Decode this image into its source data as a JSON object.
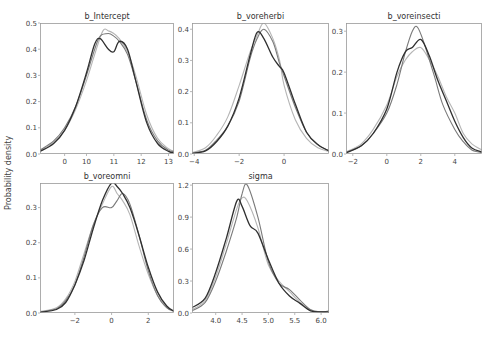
{
  "figure": {
    "ylabel": "Probability density",
    "caption_fragment": "",
    "line_colors": [
      "#2f2f2f",
      "#7a7a7a",
      "#b5b5b5"
    ],
    "frame_color": "#9a9a9a",
    "background": "#ffffff"
  },
  "chart_data": [
    {
      "type": "line",
      "title": "b_Intercept",
      "xlabel": "",
      "ylabel": "Probability density",
      "xlim": [
        8.3,
        13.2
      ],
      "ylim": [
        0,
        0.5
      ],
      "xticks": [
        0,
        10,
        11,
        12,
        13
      ],
      "xtick_positions": [
        9.2,
        10,
        11,
        12,
        13
      ],
      "yticks": [
        0.0,
        0.1,
        0.2,
        0.3,
        0.4,
        0.5
      ],
      "grid": false,
      "series": [
        {
          "name": "chain 1",
          "x": [
            8.3,
            8.8,
            9.2,
            9.6,
            10.0,
            10.3,
            10.5,
            10.8,
            11.0,
            11.2,
            11.5,
            11.8,
            12.2,
            12.6,
            13.0,
            13.2
          ],
          "y": [
            0.01,
            0.04,
            0.09,
            0.18,
            0.31,
            0.42,
            0.44,
            0.4,
            0.39,
            0.43,
            0.4,
            0.28,
            0.12,
            0.04,
            0.01,
            0.005
          ]
        },
        {
          "name": "chain 2",
          "x": [
            8.3,
            8.8,
            9.2,
            9.6,
            10.0,
            10.3,
            10.5,
            10.8,
            11.0,
            11.2,
            11.5,
            11.8,
            12.2,
            12.6,
            13.0,
            13.2
          ],
          "y": [
            0.015,
            0.05,
            0.1,
            0.18,
            0.3,
            0.4,
            0.45,
            0.46,
            0.45,
            0.43,
            0.38,
            0.28,
            0.13,
            0.05,
            0.015,
            0.01
          ]
        },
        {
          "name": "chain 3",
          "x": [
            8.3,
            8.8,
            9.2,
            9.6,
            10.0,
            10.3,
            10.6,
            10.8,
            11.0,
            11.2,
            11.5,
            11.8,
            12.2,
            12.6,
            13.0,
            13.2
          ],
          "y": [
            0.012,
            0.045,
            0.09,
            0.17,
            0.28,
            0.38,
            0.47,
            0.47,
            0.46,
            0.44,
            0.39,
            0.3,
            0.15,
            0.06,
            0.02,
            0.01
          ]
        }
      ]
    },
    {
      "type": "line",
      "title": "b_voreherbi",
      "xlabel": "",
      "ylabel": "",
      "xlim": [
        -4.1,
        2.0
      ],
      "ylim": [
        0,
        0.42
      ],
      "xticks": [
        -4,
        -2,
        0
      ],
      "yticks": [
        0.0,
        0.1,
        0.2,
        0.3,
        0.4
      ],
      "grid": false,
      "series": [
        {
          "name": "chain 1",
          "x": [
            -4.1,
            -3.5,
            -3.0,
            -2.5,
            -2.0,
            -1.5,
            -1.2,
            -0.9,
            -0.5,
            -0.2,
            0.0,
            0.5,
            1.0,
            1.5,
            2.0
          ],
          "y": [
            0.002,
            0.01,
            0.04,
            0.09,
            0.18,
            0.32,
            0.39,
            0.37,
            0.31,
            0.28,
            0.26,
            0.16,
            0.07,
            0.03,
            0.01
          ]
        },
        {
          "name": "chain 2",
          "x": [
            -4.1,
            -3.5,
            -3.0,
            -2.5,
            -2.0,
            -1.5,
            -1.2,
            -0.9,
            -0.5,
            -0.2,
            0.0,
            0.5,
            1.0,
            1.5,
            2.0
          ],
          "y": [
            0.003,
            0.012,
            0.045,
            0.09,
            0.17,
            0.31,
            0.37,
            0.4,
            0.36,
            0.29,
            0.25,
            0.15,
            0.07,
            0.03,
            0.01
          ]
        },
        {
          "name": "chain 3",
          "x": [
            -4.1,
            -3.5,
            -3.0,
            -2.5,
            -2.0,
            -1.5,
            -1.2,
            -0.9,
            -0.5,
            -0.2,
            0.0,
            0.5,
            1.0,
            1.5,
            2.0
          ],
          "y": [
            0.004,
            0.02,
            0.06,
            0.12,
            0.22,
            0.33,
            0.38,
            0.42,
            0.37,
            0.3,
            0.22,
            0.11,
            0.05,
            0.02,
            0.008
          ]
        }
      ]
    },
    {
      "type": "line",
      "title": "b_voreinsecti",
      "xlabel": "",
      "ylabel": "",
      "xlim": [
        -2.4,
        5.6
      ],
      "ylim": [
        0,
        0.32
      ],
      "xticks": [
        -2,
        0,
        2,
        4
      ],
      "yticks": [
        0.0,
        0.1,
        0.2,
        0.3
      ],
      "grid": false,
      "series": [
        {
          "name": "chain 1",
          "x": [
            -2.4,
            -1.5,
            -0.8,
            0.0,
            0.6,
            1.1,
            1.5,
            2.0,
            2.5,
            3.0,
            3.5,
            4.0,
            4.5,
            5.0,
            5.6
          ],
          "y": [
            0.003,
            0.02,
            0.05,
            0.11,
            0.2,
            0.25,
            0.26,
            0.28,
            0.24,
            0.18,
            0.13,
            0.08,
            0.04,
            0.015,
            0.005
          ]
        },
        {
          "name": "chain 2",
          "x": [
            -2.4,
            -1.5,
            -0.8,
            0.0,
            0.6,
            1.1,
            1.5,
            1.8,
            2.2,
            2.8,
            3.3,
            4.0,
            4.5,
            5.0,
            5.6
          ],
          "y": [
            0.004,
            0.02,
            0.05,
            0.1,
            0.17,
            0.25,
            0.3,
            0.31,
            0.27,
            0.19,
            0.12,
            0.06,
            0.03,
            0.01,
            0.004
          ]
        },
        {
          "name": "chain 3",
          "x": [
            -2.4,
            -1.5,
            -0.8,
            0.0,
            0.6,
            1.1,
            1.5,
            2.0,
            2.5,
            3.0,
            3.5,
            4.0,
            4.5,
            5.0,
            5.6
          ],
          "y": [
            0.005,
            0.025,
            0.06,
            0.12,
            0.19,
            0.23,
            0.25,
            0.26,
            0.23,
            0.19,
            0.14,
            0.1,
            0.05,
            0.025,
            0.01
          ]
        }
      ]
    },
    {
      "type": "line",
      "title": "b_voreomni",
      "xlabel": "",
      "ylabel": "Probability density",
      "xlim": [
        -3.9,
        3.4
      ],
      "ylim": [
        0,
        0.37
      ],
      "xticks": [
        -2,
        0,
        2
      ],
      "yticks": [
        0.0,
        0.1,
        0.2,
        0.3
      ],
      "grid": false,
      "series": [
        {
          "name": "chain 1",
          "x": [
            -3.9,
            -3.0,
            -2.5,
            -2.0,
            -1.5,
            -1.0,
            -0.5,
            0.0,
            0.3,
            0.6,
            1.0,
            1.5,
            2.0,
            2.5,
            3.0,
            3.4
          ],
          "y": [
            0.002,
            0.01,
            0.03,
            0.08,
            0.15,
            0.24,
            0.32,
            0.37,
            0.36,
            0.34,
            0.3,
            0.22,
            0.13,
            0.06,
            0.02,
            0.005
          ]
        },
        {
          "name": "chain 2",
          "x": [
            -3.9,
            -3.0,
            -2.5,
            -2.0,
            -1.5,
            -1.0,
            -0.5,
            0.0,
            0.3,
            0.6,
            1.0,
            1.5,
            2.0,
            2.5,
            3.0,
            3.4
          ],
          "y": [
            0.003,
            0.012,
            0.035,
            0.08,
            0.16,
            0.25,
            0.3,
            0.3,
            0.32,
            0.34,
            0.31,
            0.22,
            0.12,
            0.05,
            0.015,
            0.005
          ]
        },
        {
          "name": "chain 3",
          "x": [
            -3.9,
            -3.0,
            -2.5,
            -2.0,
            -1.5,
            -1.0,
            -0.5,
            0.0,
            0.3,
            0.6,
            1.0,
            1.5,
            2.0,
            2.5,
            3.0,
            3.4
          ],
          "y": [
            0.004,
            0.015,
            0.04,
            0.09,
            0.17,
            0.25,
            0.31,
            0.36,
            0.34,
            0.32,
            0.28,
            0.19,
            0.11,
            0.05,
            0.015,
            0.006
          ]
        }
      ]
    },
    {
      "type": "line",
      "title": "sigma",
      "xlabel": "",
      "ylabel": "",
      "xlim": [
        3.55,
        6.15
      ],
      "ylim": [
        0,
        1.22
      ],
      "xticks": [
        4.0,
        4.5,
        5.0,
        5.5,
        6.0
      ],
      "yticks": [
        0.0,
        0.3,
        0.6,
        0.9,
        1.2
      ],
      "grid": false,
      "series": [
        {
          "name": "chain 1",
          "x": [
            3.55,
            3.8,
            4.0,
            4.2,
            4.4,
            4.5,
            4.65,
            4.8,
            5.0,
            5.2,
            5.4,
            5.6,
            5.8,
            6.0,
            6.15
          ],
          "y": [
            0.05,
            0.14,
            0.38,
            0.7,
            1.05,
            1.0,
            0.82,
            0.75,
            0.5,
            0.28,
            0.16,
            0.09,
            0.02,
            0.01,
            0.01
          ]
        },
        {
          "name": "chain 2",
          "x": [
            3.55,
            3.8,
            4.0,
            4.2,
            4.4,
            4.5,
            4.6,
            4.8,
            5.0,
            5.2,
            5.4,
            5.6,
            5.8,
            6.0,
            6.15
          ],
          "y": [
            0.02,
            0.1,
            0.3,
            0.58,
            0.9,
            1.12,
            1.2,
            0.9,
            0.48,
            0.28,
            0.22,
            0.12,
            0.03,
            0.01,
            0.02
          ]
        },
        {
          "name": "chain 3",
          "x": [
            3.55,
            3.8,
            4.0,
            4.2,
            4.4,
            4.5,
            4.6,
            4.8,
            5.0,
            5.2,
            5.4,
            5.6,
            5.8,
            6.0,
            6.15
          ],
          "y": [
            0.03,
            0.12,
            0.34,
            0.65,
            0.98,
            1.08,
            1.05,
            0.8,
            0.45,
            0.3,
            0.2,
            0.1,
            0.03,
            0.01,
            0.01
          ]
        }
      ]
    }
  ],
  "layout": {
    "panels": [
      {
        "left": 40,
        "top": 23,
        "width": 134,
        "height": 131
      },
      {
        "left": 192,
        "top": 23,
        "width": 137,
        "height": 131
      },
      {
        "left": 346,
        "top": 23,
        "width": 136,
        "height": 131
      },
      {
        "left": 40,
        "top": 183,
        "width": 134,
        "height": 130
      },
      {
        "left": 192,
        "top": 183,
        "width": 137,
        "height": 130
      }
    ]
  }
}
